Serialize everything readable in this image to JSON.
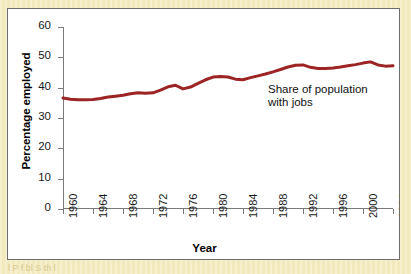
{
  "figure": {
    "background_color": "#f5ecc4",
    "plot_background_color": "#ffffff",
    "frame_color": "#6d6d6d",
    "bleed_text": "l    P    f    bl S  th  l  "
  },
  "chart_data": {
    "type": "line",
    "title": "",
    "xlabel": "Year",
    "ylabel": "Percentage employed",
    "xlim": [
      1960,
      2004
    ],
    "ylim": [
      0,
      60
    ],
    "grid": false,
    "legend_position": "none",
    "line_color": "#9d2424",
    "axis_color": "#7a7a7a",
    "y_ticks": [
      0,
      10,
      20,
      30,
      40,
      50,
      60
    ],
    "y_tick_labels": [
      "0",
      "10",
      "20",
      "30",
      "40",
      "50",
      "60"
    ],
    "x_ticks": [
      1960,
      1964,
      1968,
      1972,
      1976,
      1980,
      1984,
      1988,
      1992,
      1996,
      2000,
      2004
    ],
    "x_tick_labels": [
      "1960",
      "1964",
      "1968",
      "1972",
      "1976",
      "1980",
      "1984",
      "1988",
      "1992",
      "1996",
      "2000",
      "2004"
    ],
    "annotations": [
      {
        "text_line_1": "Share of population",
        "text_line_2": "with jobs",
        "x": 1988,
        "y": 40
      }
    ],
    "series": [
      {
        "name": "Share of population with jobs",
        "x": [
          1960,
          1961,
          1962,
          1963,
          1964,
          1965,
          1966,
          1967,
          1968,
          1969,
          1970,
          1971,
          1972,
          1973,
          1974,
          1975,
          1976,
          1977,
          1978,
          1979,
          1980,
          1981,
          1982,
          1983,
          1984,
          1985,
          1986,
          1987,
          1988,
          1989,
          1990,
          1991,
          1992,
          1993,
          1994,
          1995,
          1996,
          1997,
          1998,
          1999,
          2000,
          2001,
          2002,
          2003,
          2004
        ],
        "values": [
          36.6,
          36.2,
          36.0,
          36.0,
          36.1,
          36.4,
          36.9,
          37.2,
          37.5,
          38.0,
          38.3,
          38.2,
          38.3,
          39.2,
          40.3,
          40.8,
          39.6,
          40.2,
          41.4,
          42.6,
          43.5,
          43.7,
          43.5,
          42.8,
          42.6,
          43.3,
          43.9,
          44.5,
          45.2,
          46.0,
          46.8,
          47.4,
          47.5,
          46.7,
          46.3,
          46.3,
          46.5,
          46.8,
          47.2,
          47.6,
          48.1,
          48.5,
          47.5,
          47.1,
          47.2
        ]
      }
    ]
  }
}
